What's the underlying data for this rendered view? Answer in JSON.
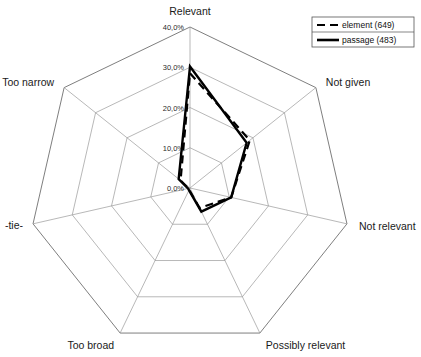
{
  "chart_data": {
    "type": "line",
    "chart_style": "radar",
    "title": "",
    "xlabel": "",
    "ylabel": "",
    "categories": [
      "Relevant",
      "Not given",
      "Not relevant",
      "Possibly relevant",
      "Too broad",
      "-tie-",
      "Too narrow"
    ],
    "tick_labels": [
      "0,0%",
      "10,0%",
      "20,0%",
      "30,0%",
      "40,0%"
    ],
    "tick_values": [
      0,
      10,
      20,
      30,
      40
    ],
    "ylim": [
      0,
      40
    ],
    "grid": true,
    "legend_position": "top-right",
    "series": [
      {
        "name": "element (649)",
        "style": "dashed",
        "color": "#000000",
        "values": [
          28.5,
          19.0,
          10.5,
          5.5,
          0.5,
          0.4,
          3.0
        ]
      },
      {
        "name": "passage (483)",
        "style": "solid",
        "color": "#000000",
        "values": [
          30.2,
          18.0,
          10.5,
          6.5,
          0.6,
          0.5,
          3.6
        ]
      }
    ]
  },
  "legend": {
    "entries": [
      {
        "label": "element (649)",
        "style": "dashed"
      },
      {
        "label": "passage (483)",
        "style": "solid"
      }
    ]
  },
  "axes": {
    "labels": [
      {
        "name": "Relevant"
      },
      {
        "name": "Not given"
      },
      {
        "name": "Not relevant"
      },
      {
        "name": "Possibly relevant"
      },
      {
        "name": "Too broad"
      },
      {
        "name": "-tie-"
      },
      {
        "name": "Too narrow"
      }
    ]
  },
  "colors": {
    "background": "#ffffff",
    "grid": "#9a9a9a",
    "series": "#000000",
    "text": "#111111"
  }
}
